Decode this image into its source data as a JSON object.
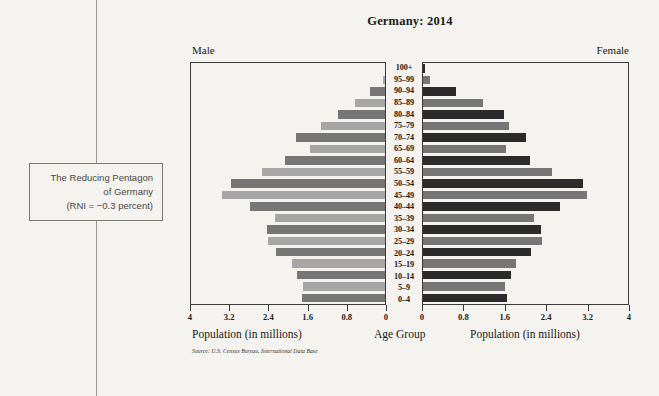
{
  "caption": {
    "line1": "The Reducing Pentagon",
    "line2": "of Germany",
    "line3": "(RNI = −0.3 percent)"
  },
  "chart_data": {
    "type": "bar",
    "subtype": "population-pyramid",
    "title": "Germany: 2014",
    "left_panel_label": "Male",
    "right_panel_label": "Female",
    "xlabel_left": "Population (in millions)",
    "xlabel_center": "Age Group",
    "xlabel_right": "Population (in millions)",
    "source": "Source: U.S. Census Bureau, International Data Base",
    "xlim": [
      0,
      4
    ],
    "xticks": [
      4,
      3.2,
      2.4,
      1.6,
      0.8,
      0
    ],
    "xticks_right": [
      0,
      0.8,
      1.6,
      2.4,
      3.2,
      4
    ],
    "grid": false,
    "legend": "none",
    "categories": [
      "100+",
      "95–99",
      "90–94",
      "85–89",
      "80–84",
      "75–79",
      "70–74",
      "65–69",
      "60–64",
      "55–59",
      "50–54",
      "45–49",
      "40–44",
      "35–39",
      "30–34",
      "25–29",
      "20–24",
      "15–19",
      "10–14",
      "5–9",
      "0–4"
    ],
    "series": [
      {
        "name": "Male",
        "values": [
          0.01,
          0.05,
          0.3,
          0.62,
          0.96,
          1.33,
          1.83,
          1.54,
          2.07,
          2.53,
          3.17,
          3.37,
          2.79,
          2.26,
          2.44,
          2.42,
          2.24,
          1.91,
          1.81,
          1.69,
          1.72
        ]
      },
      {
        "name": "Female",
        "values": [
          0.03,
          0.14,
          0.64,
          1.17,
          1.58,
          1.68,
          2.0,
          1.61,
          2.09,
          2.51,
          3.12,
          3.2,
          2.68,
          2.16,
          2.3,
          2.33,
          2.11,
          1.81,
          1.72,
          1.6,
          1.63
        ]
      }
    ],
    "colors": {
      "bar_light": "#a6a6a6",
      "bar_mid": "#767676",
      "bar_dark": "#2b2b2b",
      "frame": "#3a3a3a",
      "background": "#f4f3f0"
    }
  }
}
